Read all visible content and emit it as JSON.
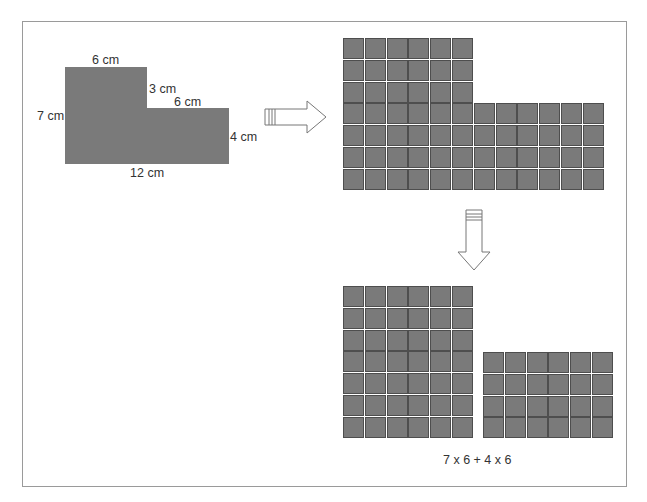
{
  "figure": {
    "original_shape": {
      "type": "L-shape",
      "fill": "#7a7a7a",
      "labels": {
        "top": "6 cm",
        "left": "7 cm",
        "step_vertical": "3 cm",
        "step_horizontal": "6 cm",
        "right": "4 cm",
        "bottom": "12 cm"
      }
    },
    "arrows": [
      {
        "name": "right-arrow",
        "direction": "right"
      },
      {
        "name": "down-arrow",
        "direction": "down"
      }
    ],
    "unit_grid": {
      "description": "L-shape tiled with 1 cm unit squares",
      "upper_block": {
        "rows": 3,
        "cols": 6
      },
      "lower_block": {
        "rows": 4,
        "cols": 12
      },
      "cell_color": "#7a7a7a",
      "line_color": "#4e4e4e"
    },
    "split_grids": {
      "left_rect": {
        "rows": 7,
        "cols": 6
      },
      "right_rect": {
        "rows": 4,
        "cols": 6
      }
    },
    "formula": "7 x 6 + 4 x 6"
  }
}
